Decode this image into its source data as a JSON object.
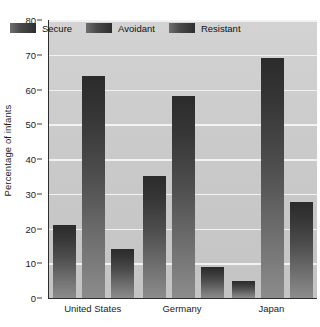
{
  "chart_data": {
    "type": "bar",
    "title": "",
    "xlabel": "",
    "ylabel": "Percentage of infants",
    "ylim": [
      0,
      80
    ],
    "yticks": [
      0,
      10,
      20,
      30,
      40,
      50,
      60,
      70,
      80
    ],
    "ytick_labels": [
      "0",
      "10",
      "20",
      "30",
      "40",
      "50",
      "60",
      "70",
      "80"
    ],
    "grid": true,
    "legend_position": "inside-top",
    "categories": [
      "United States",
      "Germany",
      "Japan"
    ],
    "series": [
      {
        "name": "Secure",
        "values": [
          21,
          35,
          5
        ]
      },
      {
        "name": "Avoidant",
        "values": [
          64,
          58,
          69
        ]
      },
      {
        "name": "Resistant",
        "values": [
          14,
          9,
          27.5
        ]
      }
    ],
    "colors": {
      "plot_background": "#cdcdcd",
      "gridline": "#f2f2f2",
      "axis": "#2e2e2e",
      "bar_top": "#2b2b2b",
      "bar_bottom": "#8c8c8c",
      "text": "#1b1b1b",
      "page_background": "#ffffff"
    }
  }
}
